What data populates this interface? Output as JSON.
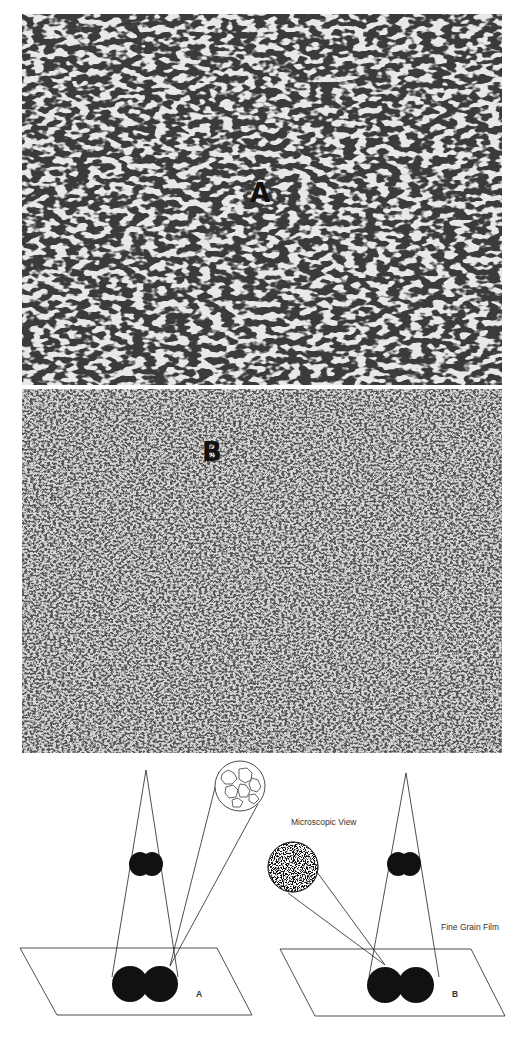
{
  "photos": [
    {
      "id": "A",
      "label": "A",
      "description": "coarse grain film micrograph"
    },
    {
      "id": "B",
      "label": "B",
      "description": "fine grain film micrograph"
    }
  ],
  "diagram": {
    "microscopic_view_label": "Microscopic View",
    "fine_grain_film_label": "Fine Grain Film",
    "panel_a_label": "A",
    "panel_b_label": "B"
  },
  "colors": {
    "ink": "#111111",
    "paper": "#ffffff",
    "photo_a_bg": "#e6e6e6",
    "photo_b_bg": "#cfcfcf"
  }
}
